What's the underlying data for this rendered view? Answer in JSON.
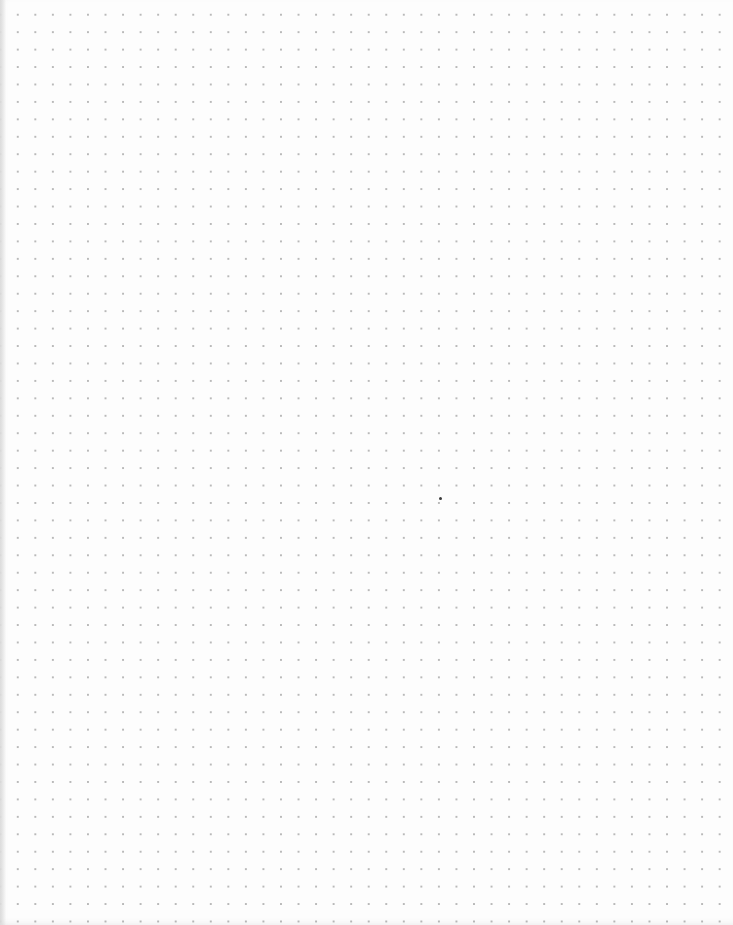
{
  "page": {
    "type": "dot-grid paper",
    "background_color": "#fdfdfd",
    "dot_color": "#b9b9b9",
    "dot_spacing_px": 17.5,
    "columns": 41,
    "rows": 52
  },
  "mark": {
    "color": "#3a3a3a",
    "x": 439,
    "y": 497
  }
}
